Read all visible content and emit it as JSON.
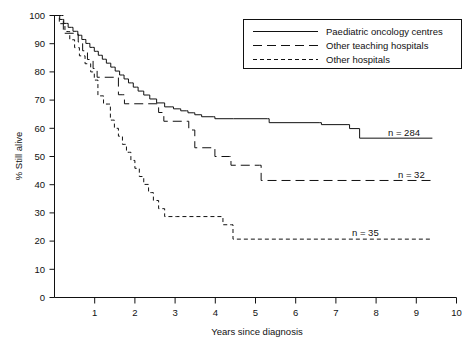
{
  "chart_data": {
    "type": "line",
    "title": "",
    "xlabel": "Years since diagnosis",
    "ylabel": "% Still alive",
    "xlim": [
      0,
      10
    ],
    "ylim": [
      0,
      100
    ],
    "grid": false,
    "legend_position": "top-right",
    "xticks": [
      0,
      1,
      2,
      3,
      4,
      5,
      6,
      7,
      8,
      9,
      10
    ],
    "xtick_labels": [
      "0",
      "1",
      "2",
      "3",
      "4",
      "5",
      "6",
      "7",
      "8",
      "9",
      "10"
    ],
    "yticks": [
      0,
      10,
      20,
      30,
      40,
      50,
      60,
      70,
      80,
      90,
      100
    ],
    "ytick_labels": [
      "0",
      "10",
      "20",
      "30",
      "40",
      "50",
      "60",
      "70",
      "80",
      "90",
      "100"
    ],
    "series": [
      {
        "name": "Paediatric oncology centres",
        "style": "solid",
        "annotation": "n = 284",
        "n": 284,
        "final_value": 56.5,
        "points": [
          [
            0.0,
            100.0
          ],
          [
            0.1,
            100.0
          ],
          [
            0.13,
            98.6
          ],
          [
            0.2,
            98.6
          ],
          [
            0.23,
            97.2
          ],
          [
            0.3,
            97.2
          ],
          [
            0.34,
            95.8
          ],
          [
            0.42,
            95.8
          ],
          [
            0.46,
            94.4
          ],
          [
            0.55,
            94.4
          ],
          [
            0.58,
            93.0
          ],
          [
            0.64,
            93.0
          ],
          [
            0.68,
            91.5
          ],
          [
            0.74,
            91.5
          ],
          [
            0.78,
            90.1
          ],
          [
            0.84,
            90.1
          ],
          [
            0.88,
            88.7
          ],
          [
            0.95,
            88.7
          ],
          [
            0.99,
            87.3
          ],
          [
            1.05,
            87.3
          ],
          [
            1.09,
            85.9
          ],
          [
            1.15,
            85.9
          ],
          [
            1.19,
            84.5
          ],
          [
            1.25,
            84.5
          ],
          [
            1.29,
            83.1
          ],
          [
            1.36,
            83.1
          ],
          [
            1.4,
            81.7
          ],
          [
            1.47,
            81.7
          ],
          [
            1.51,
            80.3
          ],
          [
            1.58,
            80.3
          ],
          [
            1.62,
            78.9
          ],
          [
            1.69,
            78.9
          ],
          [
            1.73,
            77.5
          ],
          [
            1.8,
            77.5
          ],
          [
            1.84,
            76.1
          ],
          [
            1.92,
            76.1
          ],
          [
            1.96,
            74.6
          ],
          [
            2.04,
            74.6
          ],
          [
            2.08,
            73.2
          ],
          [
            2.18,
            73.2
          ],
          [
            2.22,
            71.8
          ],
          [
            2.33,
            71.8
          ],
          [
            2.37,
            70.4
          ],
          [
            2.5,
            70.4
          ],
          [
            2.54,
            69.0
          ],
          [
            2.7,
            69.0
          ],
          [
            2.74,
            67.6
          ],
          [
            2.92,
            67.6
          ],
          [
            2.96,
            66.9
          ],
          [
            3.1,
            66.9
          ],
          [
            3.14,
            66.2
          ],
          [
            3.28,
            66.2
          ],
          [
            3.32,
            65.5
          ],
          [
            3.45,
            65.5
          ],
          [
            3.49,
            64.8
          ],
          [
            3.62,
            64.8
          ],
          [
            3.66,
            64.1
          ],
          [
            3.95,
            64.1
          ],
          [
            3.99,
            63.4
          ],
          [
            4.45,
            63.4
          ],
          [
            4.49,
            63.4
          ],
          [
            5.3,
            63.4
          ],
          [
            5.34,
            62.0
          ],
          [
            6.6,
            62.0
          ],
          [
            6.64,
            61.3
          ],
          [
            7.3,
            61.3
          ],
          [
            7.34,
            59.9
          ],
          [
            7.55,
            59.9
          ],
          [
            7.59,
            56.5
          ],
          [
            9.4,
            56.5
          ]
        ]
      },
      {
        "name": "Other teaching hospitals",
        "style": "long-dash",
        "annotation": "n = 32",
        "n": 32,
        "final_value": 41.5,
        "points": [
          [
            0.0,
            100.0
          ],
          [
            0.18,
            100.0
          ],
          [
            0.22,
            93.7
          ],
          [
            0.55,
            93.7
          ],
          [
            0.59,
            90.6
          ],
          [
            0.66,
            90.6
          ],
          [
            0.7,
            87.5
          ],
          [
            0.78,
            87.5
          ],
          [
            0.82,
            84.4
          ],
          [
            0.92,
            84.4
          ],
          [
            0.96,
            81.2
          ],
          [
            1.02,
            81.2
          ],
          [
            1.06,
            78.1
          ],
          [
            1.18,
            78.1
          ],
          [
            1.22,
            78.1
          ],
          [
            1.55,
            78.1
          ],
          [
            1.59,
            71.9
          ],
          [
            1.7,
            71.9
          ],
          [
            1.74,
            68.7
          ],
          [
            2.55,
            68.7
          ],
          [
            2.59,
            65.6
          ],
          [
            2.68,
            65.6
          ],
          [
            2.72,
            62.5
          ],
          [
            3.3,
            62.5
          ],
          [
            3.34,
            59.4
          ],
          [
            3.45,
            59.4
          ],
          [
            3.49,
            53.1
          ],
          [
            3.95,
            53.1
          ],
          [
            3.99,
            50.0
          ],
          [
            4.35,
            50.0
          ],
          [
            4.39,
            46.9
          ],
          [
            4.6,
            46.9
          ],
          [
            4.64,
            46.9
          ],
          [
            5.1,
            46.9
          ],
          [
            5.14,
            41.5
          ],
          [
            9.4,
            41.5
          ]
        ]
      },
      {
        "name": "Other hospitals",
        "style": "short-dash",
        "annotation": "n = 35",
        "n": 35,
        "final_value": 20.7,
        "points": [
          [
            0.0,
            100.0
          ],
          [
            0.08,
            100.0
          ],
          [
            0.12,
            97.1
          ],
          [
            0.22,
            97.1
          ],
          [
            0.26,
            94.3
          ],
          [
            0.34,
            94.3
          ],
          [
            0.38,
            91.4
          ],
          [
            0.46,
            91.4
          ],
          [
            0.5,
            88.6
          ],
          [
            0.58,
            88.6
          ],
          [
            0.62,
            85.7
          ],
          [
            0.72,
            85.7
          ],
          [
            0.76,
            82.9
          ],
          [
            0.86,
            82.9
          ],
          [
            0.9,
            80.0
          ],
          [
            0.95,
            80.0
          ],
          [
            0.99,
            77.1
          ],
          [
            1.04,
            77.1
          ],
          [
            1.08,
            71.5
          ],
          [
            1.18,
            71.5
          ],
          [
            1.22,
            68.6
          ],
          [
            1.35,
            68.6
          ],
          [
            1.39,
            62.9
          ],
          [
            1.45,
            62.9
          ],
          [
            1.49,
            60.0
          ],
          [
            1.55,
            60.0
          ],
          [
            1.59,
            57.2
          ],
          [
            1.65,
            57.2
          ],
          [
            1.69,
            54.3
          ],
          [
            1.75,
            54.3
          ],
          [
            1.79,
            51.5
          ],
          [
            1.86,
            51.5
          ],
          [
            1.9,
            48.6
          ],
          [
            1.96,
            48.6
          ],
          [
            2.0,
            45.8
          ],
          [
            2.07,
            45.8
          ],
          [
            2.11,
            42.9
          ],
          [
            2.18,
            42.9
          ],
          [
            2.22,
            40.1
          ],
          [
            2.3,
            40.1
          ],
          [
            2.34,
            37.2
          ],
          [
            2.42,
            37.2
          ],
          [
            2.46,
            34.4
          ],
          [
            2.55,
            34.4
          ],
          [
            2.59,
            31.5
          ],
          [
            2.7,
            31.5
          ],
          [
            2.74,
            28.7
          ],
          [
            3.0,
            28.7
          ],
          [
            3.04,
            28.7
          ],
          [
            4.15,
            28.7
          ],
          [
            4.19,
            25.8
          ],
          [
            4.4,
            25.8
          ],
          [
            4.44,
            20.7
          ],
          [
            9.4,
            20.7
          ]
        ]
      }
    ],
    "annotations": [
      {
        "text": "n = 284",
        "x": 8.3,
        "y": 60.5
      },
      {
        "text": "n = 32",
        "x": 8.55,
        "y": 45.5
      },
      {
        "text": "n = 35",
        "x": 7.55,
        "y": 25.0
      }
    ]
  },
  "caption": {
    "text": ""
  }
}
